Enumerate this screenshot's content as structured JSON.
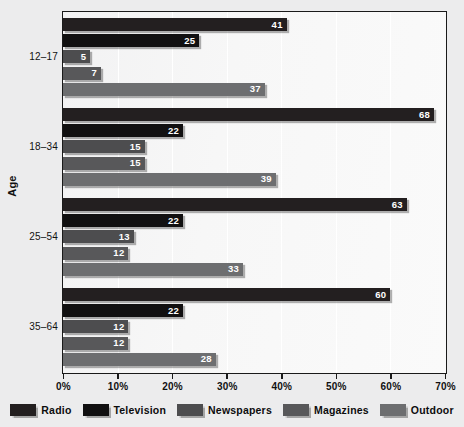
{
  "chart_data": {
    "type": "bar",
    "orientation": "horizontal",
    "title": "",
    "xlabel": "",
    "ylabel": "Age",
    "xlim": [
      0,
      70
    ],
    "xunit": "%",
    "grid": true,
    "legend_position": "bottom",
    "categories": [
      "12–17",
      "18–34",
      "25–54",
      "35–64"
    ],
    "xticks": [
      "0%",
      "10%",
      "20%",
      "30%",
      "40%",
      "50%",
      "60%",
      "70%"
    ],
    "xtick_values": [
      0,
      10,
      20,
      30,
      40,
      50,
      60,
      70
    ],
    "series": [
      {
        "name": "Radio",
        "color": "#231f20",
        "values": [
          41,
          68,
          63,
          60
        ]
      },
      {
        "name": "Television",
        "color": "#111011",
        "values": [
          25,
          22,
          22,
          22
        ]
      },
      {
        "name": "Newspapers",
        "color": "#4d4d4f",
        "values": [
          5,
          15,
          13,
          12
        ]
      },
      {
        "name": "Magazines",
        "color": "#58585a",
        "values": [
          7,
          15,
          12,
          12
        ]
      },
      {
        "name": "Outdoor",
        "color": "#6d6e70",
        "values": [
          37,
          39,
          33,
          28
        ]
      }
    ]
  },
  "axes": {
    "y_title": "Age"
  }
}
